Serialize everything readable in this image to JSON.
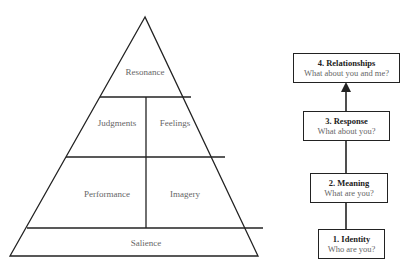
{
  "pyramid": {
    "levels": {
      "resonance": "Resonance",
      "judgments": "Judgments",
      "feelings": "Feelings",
      "performance": "Performance",
      "imagery": "Imagery",
      "salience": "Salience"
    }
  },
  "ladder": {
    "steps": [
      {
        "title": "1. Identity",
        "question": "Who are you?"
      },
      {
        "title": "2. Meaning",
        "question": "What are you?"
      },
      {
        "title": "3. Response",
        "question": "What about you?"
      },
      {
        "title": "4. Relationships",
        "question": "What about you and me?"
      }
    ]
  },
  "colors": {
    "line": "#222222",
    "label": "#666666"
  }
}
